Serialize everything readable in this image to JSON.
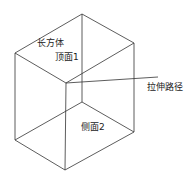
{
  "diagram": {
    "title": "长方体",
    "stroke_color": "#333333",
    "background": "#ffffff",
    "vertices": {
      "top_back": [
        82,
        14
      ],
      "top_left": [
        15,
        53
      ],
      "top_right": [
        134,
        43
      ],
      "top_front": [
        66,
        83
      ],
      "bottom_left": [
        15,
        140
      ],
      "bottom_right": [
        134,
        132
      ],
      "bottom_front": [
        65,
        170
      ],
      "bottom_back_hidden": [
        82,
        102
      ]
    },
    "path_line": {
      "from": [
        66,
        83
      ],
      "to": [
        158,
        77
      ]
    },
    "labels": {
      "solid": {
        "text": "长方体",
        "x": 37,
        "y": 38
      },
      "top_face": {
        "text": "顶面1",
        "x": 55,
        "y": 52
      },
      "extrude_path": {
        "text": "拉伸路径",
        "x": 147,
        "y": 82
      },
      "side_face": {
        "text": "侧面2",
        "x": 81,
        "y": 122
      }
    }
  }
}
